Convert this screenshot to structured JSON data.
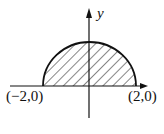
{
  "figure": {
    "type": "semicircle-region",
    "axis_labels": {
      "y": "y"
    },
    "points": [
      {
        "label": "(−2,0)",
        "x": -2,
        "y": 0
      },
      {
        "label": "(2,0)",
        "x": 2,
        "y": 0
      }
    ],
    "region": "upper half of disk x^2+y^2<=4, hatched",
    "colors": {
      "stroke": "#111111",
      "background": "#ffffff"
    }
  }
}
